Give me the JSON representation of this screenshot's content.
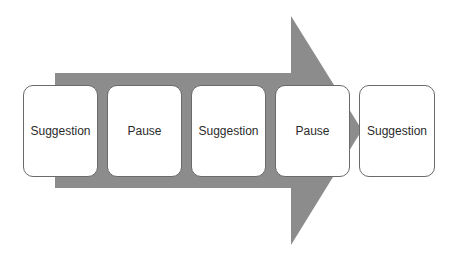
{
  "diagram": {
    "type": "process-arrow",
    "arrow_color": "#8c8c8c",
    "steps": [
      {
        "label": "Suggestion"
      },
      {
        "label": "Pause"
      },
      {
        "label": "Suggestion"
      },
      {
        "label": "Pause"
      },
      {
        "label": "Suggestion"
      }
    ]
  }
}
